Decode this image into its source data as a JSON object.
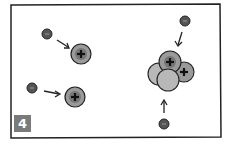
{
  "panel": {
    "number_label": "4",
    "description": "Electrons (negative) moving toward protons (positive); right side shows a nucleus cluster of protons and neutrons with electrons approaching"
  },
  "symbols": {
    "positive": "+",
    "negative": "−"
  },
  "colors": {
    "border": "#222222",
    "proton_fill": "#9a9a9a",
    "neutron_fill": "#b8b8b8",
    "electron_fill": "#555555",
    "badge_bg": "#7a7a7a",
    "badge_text": "#ffffff"
  }
}
